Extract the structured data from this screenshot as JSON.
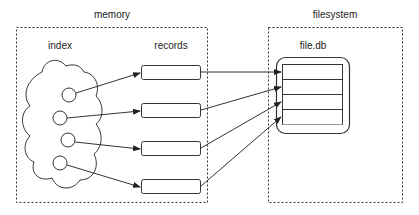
{
  "diagram": {
    "groups": [
      {
        "id": "memory",
        "label": "memory"
      },
      {
        "id": "filesystem",
        "label": "filesystem"
      }
    ],
    "memory": {
      "index_label": "index",
      "records_label": "records",
      "index_nodes": 4,
      "record_boxes": 4
    },
    "filesystem": {
      "file_label": "file.db",
      "file_rows": 5
    },
    "edges": [
      {
        "from": "index-node-1",
        "to": "record-1"
      },
      {
        "from": "index-node-2",
        "to": "record-2"
      },
      {
        "from": "index-node-3",
        "to": "record-3"
      },
      {
        "from": "index-node-4",
        "to": "record-4"
      },
      {
        "from": "record-1",
        "to": "file-row-1"
      },
      {
        "from": "record-2",
        "to": "file-row-2"
      },
      {
        "from": "record-3",
        "to": "file-row-3"
      },
      {
        "from": "record-4",
        "to": "file-row-4"
      }
    ],
    "colors": {
      "stroke": "#333333",
      "text": "#222222",
      "background": "#ffffff"
    }
  }
}
